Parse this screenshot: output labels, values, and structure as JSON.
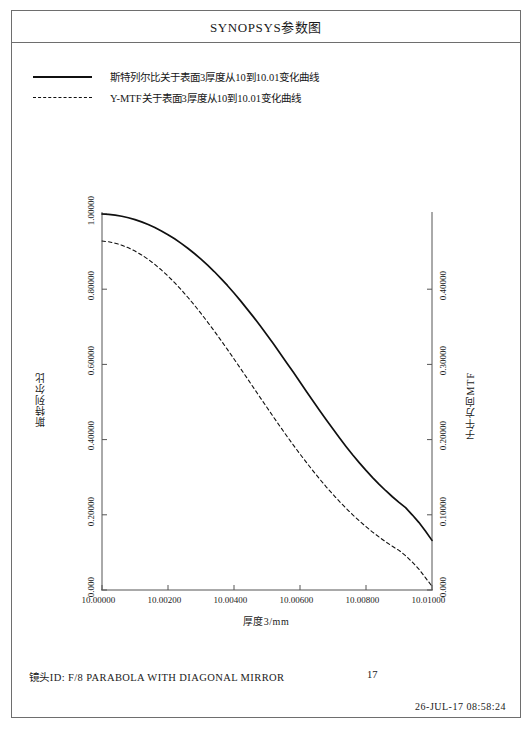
{
  "page": {
    "title": "SYNOPSYS参数图"
  },
  "legend": {
    "items": [
      {
        "style": "solid",
        "label": "斯特列尔比关于表面3厚度从10到10.01变化曲线"
      },
      {
        "style": "dashed",
        "label": "Y-MTF关于表面3厚度从10到10.01变化曲线"
      }
    ]
  },
  "footer": {
    "lens_id": "镜头ID: F/8 PARABOLA WITH DIAGONAL MIRROR",
    "page_number": "17",
    "timestamp": "26-JUL-17  08:58:24"
  },
  "colors": {
    "frame": "#6e6e6e",
    "axis": "#555555",
    "curve_solid": "#101010",
    "curve_dashed": "#101010",
    "text": "#1a1a1a",
    "background": "#ffffff"
  },
  "chart_data": {
    "type": "line",
    "title": "SYNOPSYS参数图",
    "xlabel": "厚度3/mm",
    "ylabel": "斯特列尔比",
    "y2label": "子午方向MTF",
    "grid": false,
    "legend_position": "top-left",
    "xlim": [
      10.0,
      10.01
    ],
    "ylim": [
      0.0,
      1.0
    ],
    "y2lim": [
      0.0,
      0.5
    ],
    "xticks": [
      10.0,
      10.002,
      10.004,
      10.006,
      10.008,
      10.01
    ],
    "xticklabels": [
      "10.00000",
      "10.00200",
      "10.00400",
      "10.00600",
      "10.00800",
      "10.01000"
    ],
    "yticks": [
      0.0,
      0.2,
      0.4,
      0.6,
      0.8,
      1.0
    ],
    "yticklabels": [
      "0.000",
      "0.20000",
      "0.40000",
      "0.60000",
      "0.80000",
      "1.00000"
    ],
    "y2ticks": [
      0.0,
      0.1,
      0.2,
      0.3,
      0.4
    ],
    "y2ticklabels": [
      "0.000",
      "0.10000",
      "0.20000",
      "0.30000",
      "0.40000"
    ],
    "x": [
      10.0,
      10.0002,
      10.0004,
      10.0006,
      10.0008,
      10.001,
      10.0012,
      10.0014,
      10.0016,
      10.0018,
      10.002,
      10.0022,
      10.0024,
      10.0026,
      10.0028,
      10.003,
      10.0032,
      10.0034,
      10.0036,
      10.0038,
      10.004,
      10.0042,
      10.0044,
      10.0046,
      10.0048,
      10.005,
      10.0052,
      10.0054,
      10.0056,
      10.0058,
      10.006,
      10.0062,
      10.0064,
      10.0066,
      10.0068,
      10.007,
      10.0072,
      10.0074,
      10.0076,
      10.0078,
      10.008,
      10.0082,
      10.0084,
      10.0086,
      10.0088,
      10.009,
      10.0092,
      10.0094,
      10.0096,
      10.0098,
      10.01
    ],
    "series": [
      {
        "name": "斯特列尔比关于表面3厚度从10到10.01变化曲线",
        "axis": "left",
        "style": "solid",
        "values": [
          1.0,
          0.999,
          0.997,
          0.994,
          0.99,
          0.985,
          0.979,
          0.972,
          0.964,
          0.955,
          0.945,
          0.934,
          0.922,
          0.909,
          0.895,
          0.88,
          0.864,
          0.847,
          0.829,
          0.81,
          0.79,
          0.769,
          0.747,
          0.725,
          0.702,
          0.678,
          0.654,
          0.629,
          0.604,
          0.579,
          0.553,
          0.527,
          0.502,
          0.477,
          0.452,
          0.428,
          0.404,
          0.381,
          0.359,
          0.338,
          0.318,
          0.299,
          0.281,
          0.264,
          0.248,
          0.233,
          0.219,
          0.2,
          0.18,
          0.157,
          0.132
        ]
      },
      {
        "name": "Y-MTF关于表面3厚度从10到10.01变化曲线",
        "axis": "right",
        "style": "dashed",
        "values": [
          0.464,
          0.463,
          0.4612,
          0.4585,
          0.455,
          0.4507,
          0.4456,
          0.4397,
          0.433,
          0.4256,
          0.4175,
          0.4087,
          0.3993,
          0.3893,
          0.3788,
          0.3678,
          0.3563,
          0.3445,
          0.3323,
          0.3199,
          0.3072,
          0.2944,
          0.2815,
          0.2685,
          0.2555,
          0.2426,
          0.2298,
          0.2172,
          0.2048,
          0.1926,
          0.1808,
          0.1693,
          0.1581,
          0.1473,
          0.1369,
          0.127,
          0.1175,
          0.1085,
          0.0999,
          0.0918,
          0.0842,
          0.077,
          0.0703,
          0.064,
          0.0581,
          0.0527,
          0.0456,
          0.0372,
          0.0279,
          0.0165,
          0.005
        ]
      }
    ]
  }
}
